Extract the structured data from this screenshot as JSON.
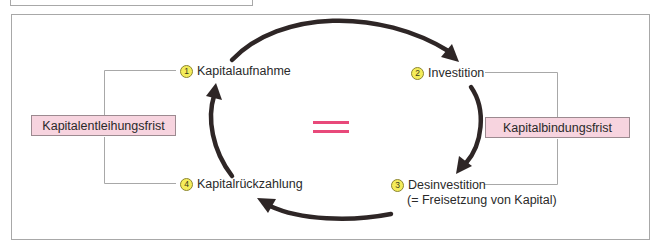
{
  "diagram": {
    "type": "cycle",
    "center_symbol": "=",
    "colors": {
      "accent_pink": "#e8497a",
      "box_fill": "#f7d4df",
      "badge_yellow": "#f4ec5a",
      "arrow": "#2e2626",
      "line": "#a8a8a8"
    },
    "steps": [
      {
        "number": "1",
        "label": "Kapitalaufnahme"
      },
      {
        "number": "2",
        "label": "Investition"
      },
      {
        "number": "3",
        "label": "Desinvestition",
        "sublabel": "(= Freisetzung von Kapital)"
      },
      {
        "number": "4",
        "label": "Kapitalrückzahlung"
      }
    ],
    "brackets": {
      "left": {
        "label": "Kapitalentleihungsfrist",
        "spans": [
          "1",
          "4"
        ]
      },
      "right": {
        "label": "Kapitalbindungsfrist",
        "spans": [
          "2",
          "3"
        ]
      }
    },
    "arrows": [
      {
        "from": "1",
        "to": "2"
      },
      {
        "from": "2",
        "to": "3"
      },
      {
        "from": "3",
        "to": "4"
      },
      {
        "from": "4",
        "to": "1"
      }
    ]
  }
}
